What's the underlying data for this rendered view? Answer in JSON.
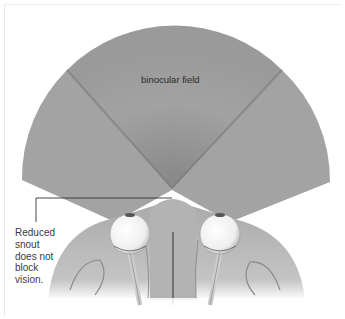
{
  "figure": {
    "labels": {
      "binocular_field": "binocular field",
      "callout": "Reduced snout does not block vision."
    },
    "callout_lines": [
      "Reduced",
      "snout",
      "does not",
      "block",
      "vision."
    ],
    "colors": {
      "field_fill": "#9c9c9c",
      "field_center": "#a0a0a0",
      "field_divider": "#7a7a7a",
      "eye": "#f4f4f4",
      "head": "#b8b8b8",
      "callout_line": "#333333"
    }
  }
}
